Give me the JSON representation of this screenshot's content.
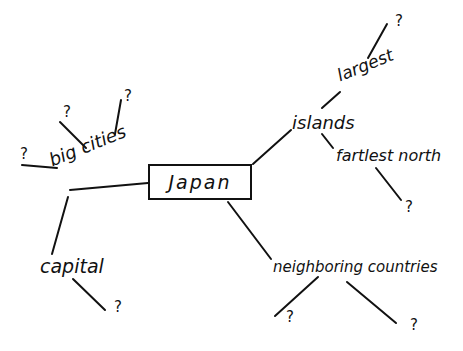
{
  "diagram": {
    "type": "mind-map",
    "style": "hand-drawn",
    "stroke_color": "#111111",
    "background": "#ffffff",
    "central": {
      "label": "Japan"
    },
    "branches": [
      {
        "label": "big cities",
        "children": [
          "?",
          "?",
          "?"
        ]
      },
      {
        "label": "capital",
        "children": [
          "?"
        ]
      },
      {
        "label": "islands",
        "children": [
          {
            "label": "largest",
            "children": [
              "?"
            ]
          },
          {
            "label": "fartlest north",
            "children": [
              "?"
            ]
          }
        ]
      },
      {
        "label": "neighboring countries",
        "children": [
          "?",
          "?"
        ]
      }
    ]
  }
}
